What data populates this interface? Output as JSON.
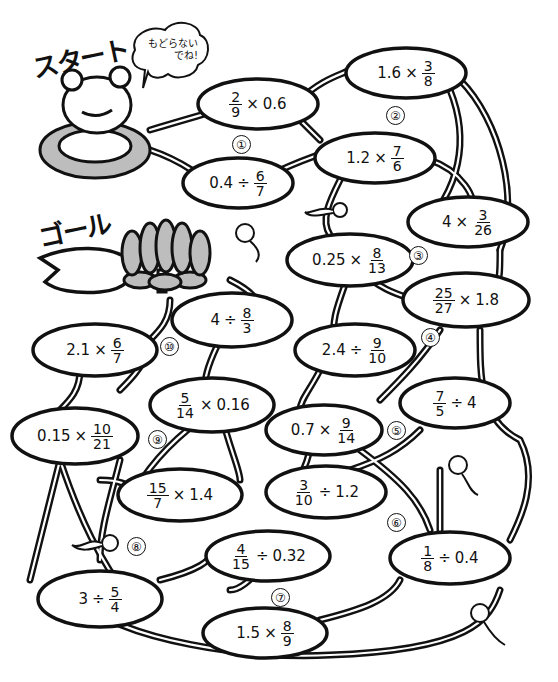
{
  "start_label": "スタート",
  "goal_label": "ゴール",
  "speech_bubble": {
    "line1": "もどらない",
    "line2": "でね!"
  },
  "colors": {
    "ink": "#111111",
    "paper": "#ffffff",
    "shade": "#bdbdbd"
  },
  "pads": [
    {
      "id": "p1a",
      "a": "",
      "op": "×",
      "b": "0.6",
      "frac_first": {
        "num": "2",
        "den": "9"
      }
    },
    {
      "id": "p1b",
      "a": "0.4",
      "op": "÷",
      "frac": {
        "num": "6",
        "den": "7"
      }
    },
    {
      "id": "p2a",
      "a": "1.6",
      "op": "×",
      "frac": {
        "num": "3",
        "den": "8"
      }
    },
    {
      "id": "p2b",
      "a": "1.2",
      "op": "×",
      "frac": {
        "num": "7",
        "den": "6"
      }
    },
    {
      "id": "p3a",
      "a": "4",
      "op": "×",
      "frac": {
        "num": "3",
        "den": "26"
      }
    },
    {
      "id": "p3b",
      "a": "0.25",
      "op": "×",
      "frac": {
        "num": "8",
        "den": "13"
      }
    },
    {
      "id": "p4a",
      "op": "×",
      "b": "1.8",
      "frac_first": {
        "num": "25",
        "den": "27"
      }
    },
    {
      "id": "p4b",
      "a": "2.4",
      "op": "÷",
      "frac": {
        "num": "9",
        "den": "10"
      }
    },
    {
      "id": "p5a",
      "op": "÷",
      "b": "4",
      "frac_first": {
        "num": "7",
        "den": "5"
      }
    },
    {
      "id": "p5b",
      "a": "0.7",
      "op": "×",
      "frac": {
        "num": "9",
        "den": "14"
      }
    },
    {
      "id": "p6a",
      "op": "÷",
      "b": "1.2",
      "frac_first": {
        "num": "3",
        "den": "10"
      }
    },
    {
      "id": "p6b",
      "op": "÷",
      "b": "0.4",
      "frac_first": {
        "num": "1",
        "den": "8"
      }
    },
    {
      "id": "p7a",
      "op": "÷",
      "b": "0.32",
      "frac_first": {
        "num": "4",
        "den": "15"
      }
    },
    {
      "id": "p7b",
      "a": "1.5",
      "op": "×",
      "frac": {
        "num": "8",
        "den": "9"
      }
    },
    {
      "id": "p8a",
      "a": "3",
      "op": "÷",
      "frac": {
        "num": "5",
        "den": "4"
      }
    },
    {
      "id": "p8b",
      "op": "×",
      "b": "1.4",
      "frac_first": {
        "num": "15",
        "den": "7"
      }
    },
    {
      "id": "p9a",
      "a": "0.15",
      "op": "×",
      "frac": {
        "num": "10",
        "den": "21"
      }
    },
    {
      "id": "p9b",
      "op": "×",
      "b": "0.16",
      "frac_first": {
        "num": "5",
        "den": "14"
      }
    },
    {
      "id": "p10a",
      "a": "2.1",
      "op": "×",
      "frac": {
        "num": "6",
        "den": "7"
      }
    },
    {
      "id": "p10b",
      "a": "4",
      "op": "÷",
      "frac": {
        "num": "8",
        "den": "3"
      }
    }
  ],
  "badges": [
    "①",
    "②",
    "③",
    "④",
    "⑤",
    "⑥",
    "⑦",
    "⑧",
    "⑨",
    "⑩"
  ]
}
